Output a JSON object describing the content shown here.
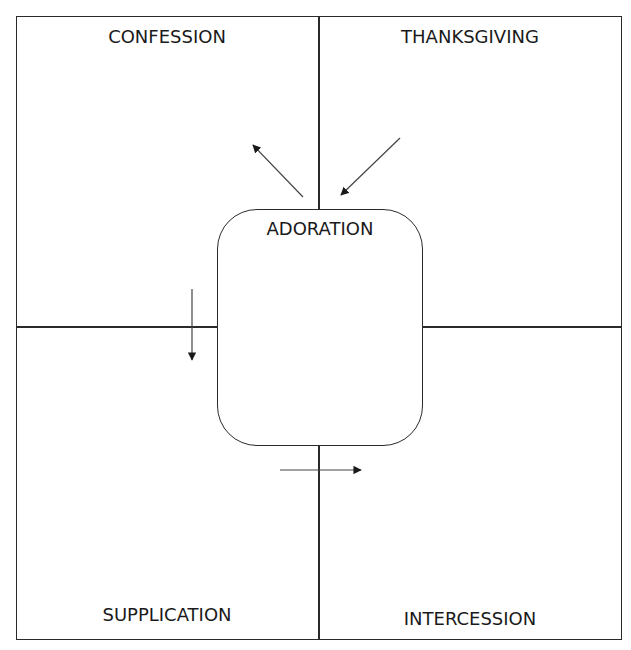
{
  "diagram": {
    "type": "quadrant-with-center",
    "center": {
      "label": "ADORATION"
    },
    "quadrants": {
      "top_left": {
        "label": "CONFESSION"
      },
      "top_right": {
        "label": "THANKSGIVING"
      },
      "bottom_left": {
        "label": "SUPPLICATION"
      },
      "bottom_right": {
        "label": "INTERCESSION"
      }
    },
    "arrows": [
      {
        "from": "ADORATION",
        "to": "CONFESSION",
        "direction": "up-left"
      },
      {
        "from": "THANKSGIVING",
        "to": "ADORATION",
        "direction": "down-left"
      },
      {
        "from": "CONFESSION",
        "to": "SUPPLICATION",
        "direction": "down"
      },
      {
        "from": "SUPPLICATION",
        "to": "INTERCESSION",
        "direction": "right"
      }
    ],
    "colors": {
      "line": "#2a2a2a",
      "text": "#1a1a1a",
      "background": "#ffffff"
    }
  }
}
